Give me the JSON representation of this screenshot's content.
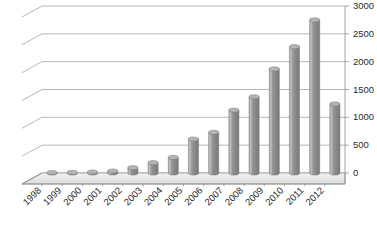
{
  "chart_data": {
    "type": "bar",
    "title": "",
    "subtitle": "",
    "xlabel": "",
    "ylabel": "",
    "ylim": [
      0,
      3000
    ],
    "ytick_step": 500,
    "yticks": [
      "0",
      "500",
      "1000",
      "1500",
      "2000",
      "2500",
      "3000"
    ],
    "ytick_values": [
      0,
      500,
      1000,
      1500,
      2000,
      2500,
      3000
    ],
    "grid": true,
    "legend": false,
    "legend_position": "none",
    "y_axis_side": "right",
    "x_label_rotation": -45,
    "style": "3d-cylinder",
    "bar_color": "#8a8a8a",
    "bar_top_color": "#b4b4b4",
    "bar_edge_color": "#6f6f6f",
    "grid_color": "#9a9a9a",
    "background": "#ffffff",
    "categories": [
      "1998",
      "1999",
      "2000",
      "2001",
      "2002",
      "2003",
      "2004",
      "2005",
      "2006",
      "2007",
      "2008",
      "2009",
      "2010",
      "2011",
      "2012"
    ],
    "values": [
      8,
      10,
      18,
      35,
      95,
      185,
      280,
      610,
      730,
      1130,
      1370,
      1870,
      2270,
      2750,
      1240
    ],
    "series": [
      {
        "name": "",
        "values": [
          8,
          10,
          18,
          35,
          95,
          185,
          280,
          610,
          730,
          1130,
          1370,
          1870,
          2270,
          2750,
          1240
        ]
      }
    ]
  }
}
